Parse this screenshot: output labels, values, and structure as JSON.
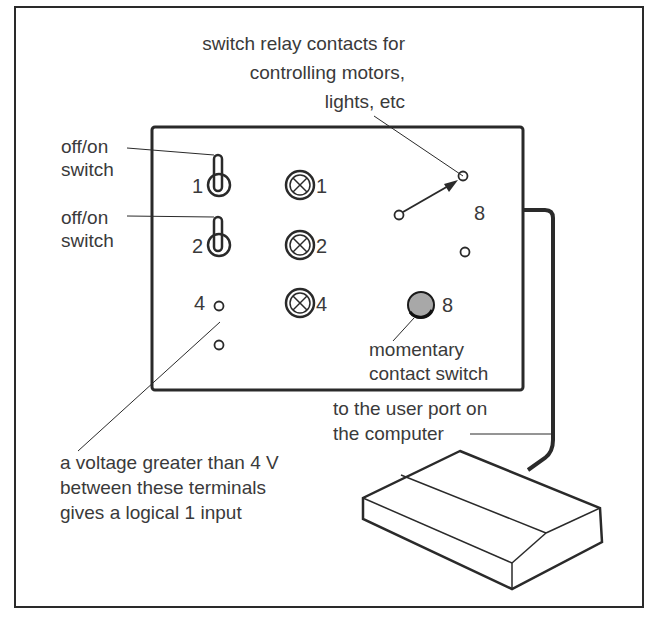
{
  "diagram": {
    "labels": {
      "relay_line1": "switch relay contacts for",
      "relay_line2": "controlling motors,",
      "relay_line3": "lights, etc",
      "switch1_line1": "off/on",
      "switch1_line2": "switch",
      "switch2_line1": "off/on",
      "switch2_line2": "switch",
      "momentary_line1": "momentary",
      "momentary_line2": "contact switch",
      "port_line1": "to the user port on",
      "port_line2": "the computer",
      "voltage_line1": "a voltage greater than 4 V",
      "voltage_line2": "between these terminals",
      "voltage_line3": "gives a logical 1 input"
    },
    "numbers": {
      "toggle1": "1",
      "toggle2": "2",
      "terminal_input": "4",
      "lamp1": "1",
      "lamp2": "2",
      "lamp4": "4",
      "relay": "8",
      "button": "8"
    },
    "colors": {
      "line": "#2a2a2a",
      "text": "#3a3a3a",
      "button_fill": "#9a9a9a"
    }
  }
}
